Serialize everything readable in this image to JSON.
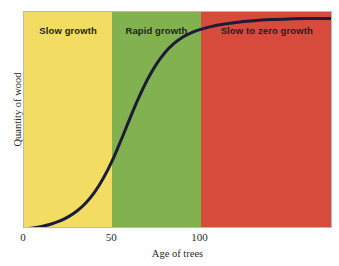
{
  "chart_data": {
    "type": "line",
    "title": "",
    "xlabel": "Age of trees",
    "ylabel": "Quantity of wood",
    "xlim": [
      0,
      175
    ],
    "ylim": [
      0,
      1
    ],
    "xticks": [
      {
        "value": 0,
        "label": "0"
      },
      {
        "value": 50,
        "label": "50"
      },
      {
        "value": 100,
        "label": "100"
      }
    ],
    "yticks": [],
    "grid": false,
    "legend": "none",
    "series": [
      {
        "name": "Quantity of wood",
        "color": "#1c1b38",
        "x": [
          0,
          5,
          10,
          15,
          20,
          25,
          30,
          35,
          40,
          45,
          50,
          55,
          60,
          65,
          70,
          75,
          80,
          85,
          90,
          95,
          100,
          110,
          120,
          130,
          140,
          150,
          160,
          175
        ],
        "y": [
          0.0,
          0.005,
          0.012,
          0.022,
          0.036,
          0.056,
          0.083,
          0.12,
          0.17,
          0.235,
          0.315,
          0.41,
          0.51,
          0.605,
          0.69,
          0.76,
          0.815,
          0.855,
          0.885,
          0.905,
          0.92,
          0.94,
          0.952,
          0.96,
          0.965,
          0.968,
          0.97,
          0.97
        ]
      }
    ],
    "bands": [
      {
        "id": "slow",
        "label": "Slow growth",
        "xstart": 0,
        "xend": 50,
        "color": "#f2dd62"
      },
      {
        "id": "rapid",
        "label": "Rapid growth",
        "xstart": 50,
        "xend": 100,
        "color": "#82b24f"
      },
      {
        "id": "zero",
        "label": "Slow to zero growth",
        "xstart": 100,
        "xend": 175,
        "color": "#d64b3c"
      }
    ],
    "annotations": [
      "Slow growth",
      "Rapid growth",
      "Slow to zero growth"
    ]
  },
  "colors": {
    "yellow": "#f2dd62",
    "green": "#82b24f",
    "red": "#d64b3c",
    "curve": "#1c1b38",
    "axis": "#b9b9b9",
    "text": "#2a2a2a",
    "label_text": "#231f1c",
    "background": "#ffffff"
  }
}
